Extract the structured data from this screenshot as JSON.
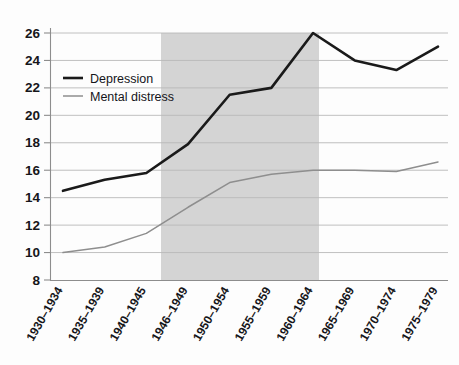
{
  "chart_data": {
    "type": "line",
    "title": "",
    "subtitle": "",
    "xlabel": "",
    "ylabel": "",
    "ylim": [
      8,
      26
    ],
    "yticks": [
      8,
      10,
      12,
      14,
      16,
      18,
      20,
      22,
      24,
      26
    ],
    "grid": true,
    "legend_position": "top-left-inside",
    "categories": [
      "1930–1934",
      "1935–1939",
      "1940–1945",
      "1946–1949",
      "1950–1954",
      "1955–1959",
      "1960–1964",
      "1965–1969",
      "1970–1974",
      "1975–1979"
    ],
    "series": [
      {
        "name": "Depression",
        "color": "#1a1a1a",
        "stroke_width": 2.6,
        "values": [
          14.5,
          15.3,
          15.8,
          17.9,
          21.5,
          22.0,
          26.0,
          24.0,
          23.3,
          25.0
        ]
      },
      {
        "name": "Mental distress",
        "color": "#8e8e8e",
        "stroke_width": 1.5,
        "values": [
          10.0,
          10.4,
          11.4,
          13.3,
          15.1,
          15.7,
          16.0,
          16.0,
          15.9,
          16.6
        ]
      }
    ],
    "shaded_band": {
      "label": "",
      "color": "#d4d4d4",
      "from_category": "1946–1949",
      "to_category": "1960–1964",
      "x_start_px": 161,
      "x_end_px": 319
    }
  },
  "legend": {
    "entries": [
      {
        "label": "Depression",
        "color": "#1a1a1a"
      },
      {
        "label": "Mental distress",
        "color": "#8e8e8e"
      }
    ]
  }
}
